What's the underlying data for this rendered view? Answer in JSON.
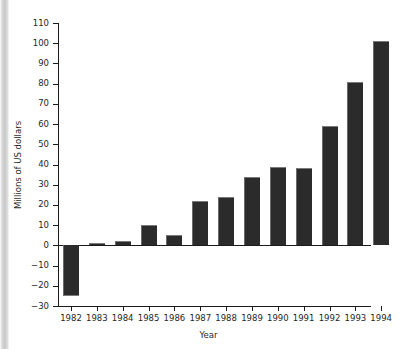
{
  "chart_data": {
    "type": "bar",
    "title": "",
    "subtitle": "",
    "xlabel": "Year",
    "ylabel": "Millions of US dollars",
    "categories": [
      "1982",
      "1983",
      "1984",
      "1985",
      "1986",
      "1987",
      "1988",
      "1989",
      "1990",
      "1991",
      "1992",
      "1993",
      "1994"
    ],
    "values": [
      -25,
      1,
      2,
      10,
      5,
      22,
      24,
      34,
      39,
      38.5,
      59,
      81,
      101
    ],
    "series": [
      {
        "name": "Millions of US dollars",
        "values": [
          -25,
          1,
          2,
          10,
          5,
          22,
          24,
          34,
          39,
          38.5,
          59,
          81,
          101
        ]
      }
    ],
    "ylim": [
      -30,
      110
    ],
    "ytick_values": [
      -30,
      -20,
      -10,
      0,
      10,
      20,
      30,
      40,
      50,
      60,
      70,
      80,
      90,
      100,
      110
    ],
    "ytick_labels": [
      "−30",
      "−20",
      "−10",
      "0",
      "10",
      "20",
      "30",
      "40",
      "50",
      "60",
      "70",
      "80",
      "90",
      "100",
      "110"
    ],
    "grid": false,
    "legend": null,
    "legend_position": "none",
    "bar_color": "#2b2b2b",
    "axis_color": "#1a1a1a",
    "annotations": []
  },
  "figure": {
    "background_color": "#ffffff",
    "text_color": "#1f1f1f"
  }
}
